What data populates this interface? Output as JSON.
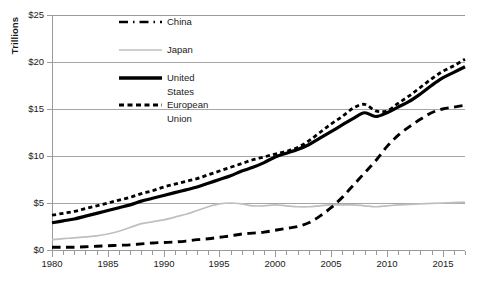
{
  "axis": {
    "y_title": "Trillions",
    "y_ticks": [
      "$25",
      "$20",
      "$15",
      "$10",
      "$5",
      "$0"
    ],
    "x_ticks": [
      "1980",
      "1985",
      "1990",
      "1995",
      "2000",
      "2005",
      "2010",
      "2015"
    ]
  },
  "legend": {
    "items": [
      {
        "label": "China",
        "style": "long-dash",
        "color": "#000000"
      },
      {
        "label": "Japan",
        "style": "solid-thin",
        "color": "#bfbfbf"
      },
      {
        "label_line1": "United",
        "label_line2": "States",
        "style": "solid-thick",
        "color": "#000000"
      },
      {
        "label_line1": "European",
        "label_line2": "Union",
        "style": "short-dash",
        "color": "#000000"
      }
    ],
    "china_label": "China",
    "japan_label": "Japan",
    "us_label_1": "United",
    "us_label_2": "States",
    "eu_label_1": "European",
    "eu_label_2": "Union"
  },
  "colors": {
    "china": "#000000",
    "japan": "#bfbfbf",
    "united_states": "#000000",
    "european_union": "#000000",
    "gridline": "#a6a6a6",
    "axis": "#9a9a9a",
    "background": "#ffffff"
  },
  "chart_data": {
    "type": "line",
    "title": "",
    "subtitle": "",
    "xlabel": "",
    "ylabel": "Trillions",
    "ylim": [
      0,
      25
    ],
    "xlim": [
      1980,
      2017
    ],
    "y_tick_values": [
      0,
      5,
      10,
      15,
      20,
      25
    ],
    "y_tick_labels": [
      "$0",
      "$5",
      "$10",
      "$15",
      "$20",
      "$25"
    ],
    "x_tick_values": [
      1980,
      1985,
      1990,
      1995,
      2000,
      2005,
      2010,
      2015
    ],
    "x_minor_tick_interval": 1,
    "grid": "horizontal",
    "legend_position": "upper-center-left",
    "units": "trillions of US dollars (nominal GDP)",
    "x": [
      1980,
      1981,
      1982,
      1983,
      1984,
      1985,
      1986,
      1987,
      1988,
      1989,
      1990,
      1991,
      1992,
      1993,
      1994,
      1995,
      1996,
      1997,
      1998,
      1999,
      2000,
      2001,
      2002,
      2003,
      2004,
      2005,
      2006,
      2007,
      2008,
      2009,
      2010,
      2011,
      2012,
      2013,
      2014,
      2015,
      2016,
      2017
    ],
    "series": [
      {
        "name": "China",
        "style": "long-dash",
        "color": "#000000",
        "values": [
          0.3,
          0.29,
          0.28,
          0.3,
          0.31,
          0.31,
          0.3,
          0.33,
          0.41,
          0.46,
          0.4,
          0.41,
          0.49,
          0.62,
          0.56,
          0.73,
          0.86,
          0.96,
          1.03,
          1.09,
          1.21,
          1.34,
          1.47,
          1.66,
          1.96,
          2.29,
          2.75,
          3.55,
          4.6,
          5.1,
          6.09,
          7.55,
          8.53,
          9.57,
          10.48,
          11.06,
          11.23,
          12.24
        ]
      },
      {
        "name": "Japan",
        "style": "solid-thin",
        "color": "#bfbfbf",
        "values": [
          1.1,
          1.22,
          1.13,
          1.24,
          1.31,
          1.4,
          2.08,
          2.53,
          3.07,
          3.05,
          3.14,
          3.58,
          3.91,
          4.46,
          4.91,
          5.45,
          4.83,
          4.41,
          4.03,
          4.56,
          4.89,
          4.3,
          4.12,
          4.45,
          4.82,
          4.76,
          4.53,
          4.52,
          5.04,
          5.23,
          5.7,
          6.16,
          6.2,
          5.16,
          4.85,
          4.39,
          4.95,
          4.87
        ]
      },
      {
        "name": "United States",
        "style": "solid-thick",
        "color": "#000000",
        "values": [
          2.86,
          3.21,
          3.34,
          3.64,
          4.04,
          4.34,
          4.58,
          4.86,
          5.25,
          5.66,
          5.98,
          6.17,
          6.54,
          6.88,
          7.31,
          7.66,
          8.1,
          8.61,
          9.09,
          9.66,
          10.25,
          10.58,
          10.94,
          11.46,
          12.21,
          13.04,
          13.81,
          14.45,
          14.71,
          14.45,
          14.99,
          15.54,
          16.2,
          16.78,
          17.52,
          18.22,
          18.71,
          19.49
        ]
      },
      {
        "name": "European Union",
        "style": "short-dash",
        "color": "#000000",
        "values": [
          3.72,
          3.32,
          3.21,
          3.09,
          3.0,
          3.1,
          4.12,
          5.06,
          5.69,
          5.87,
          7.28,
          7.5,
          8.24,
          7.38,
          7.83,
          9.2,
          9.23,
          8.72,
          9.07,
          9.03,
          8.51,
          8.63,
          9.5,
          11.58,
          13.3,
          13.88,
          14.82,
          17.05,
          18.35,
          16.43,
          16.96,
          17.79,
          17.08,
          18.02,
          18.61,
          16.4,
          16.51,
          20.3
        ]
      }
    ],
    "series_display": {
      "note": "rendered curve values (smoothed reading off the plotted lines)",
      "china": [
        0.3,
        0.3,
        0.3,
        0.35,
        0.4,
        0.45,
        0.5,
        0.55,
        0.65,
        0.75,
        0.8,
        0.85,
        0.95,
        1.1,
        1.2,
        1.35,
        1.5,
        1.7,
        1.8,
        1.9,
        2.1,
        2.3,
        2.5,
        2.9,
        3.6,
        4.5,
        5.6,
        6.9,
        8.2,
        9.5,
        11.0,
        12.2,
        13.1,
        13.9,
        14.6,
        15.0,
        15.2,
        15.4
      ],
      "japan": [
        1.1,
        1.2,
        1.3,
        1.4,
        1.5,
        1.7,
        2.0,
        2.4,
        2.8,
        3.0,
        3.2,
        3.5,
        3.8,
        4.2,
        4.6,
        4.9,
        5.0,
        4.9,
        4.7,
        4.7,
        4.8,
        4.7,
        4.6,
        4.6,
        4.7,
        4.8,
        4.8,
        4.8,
        4.7,
        4.6,
        4.7,
        4.8,
        4.85,
        4.9,
        4.95,
        5.0,
        5.05,
        5.1
      ],
      "united_states": [
        2.9,
        3.1,
        3.3,
        3.6,
        3.9,
        4.2,
        4.5,
        4.8,
        5.2,
        5.5,
        5.8,
        6.1,
        6.4,
        6.7,
        7.1,
        7.5,
        7.9,
        8.4,
        8.8,
        9.3,
        9.9,
        10.3,
        10.7,
        11.2,
        11.9,
        12.6,
        13.3,
        14.0,
        14.6,
        14.2,
        14.6,
        15.2,
        15.8,
        16.6,
        17.5,
        18.3,
        18.9,
        19.5
      ],
      "european_union": [
        3.7,
        3.9,
        4.1,
        4.4,
        4.7,
        5.0,
        5.3,
        5.6,
        6.0,
        6.3,
        6.7,
        7.0,
        7.3,
        7.6,
        8.0,
        8.4,
        8.8,
        9.2,
        9.6,
        9.9,
        10.2,
        10.5,
        10.9,
        11.6,
        12.5,
        13.4,
        14.2,
        15.1,
        15.5,
        14.8,
        14.8,
        15.6,
        16.4,
        17.3,
        18.2,
        19.0,
        19.6,
        20.3
      ]
    }
  }
}
